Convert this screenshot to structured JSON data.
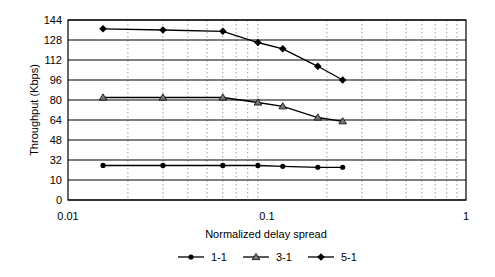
{
  "chart_data": {
    "type": "line",
    "title": "",
    "xlabel": "Normalized delay spread",
    "ylabel": "Throughput (Kbps)",
    "xscale": "log",
    "xlim": [
      0.01,
      1
    ],
    "x_tick_labels": [
      "0.01",
      "0.1",
      "1"
    ],
    "y_tick_labels": [
      "0",
      "10",
      "32",
      "48",
      "64",
      "80",
      "96",
      "112",
      "128",
      "144"
    ],
    "y_ticks": [
      0,
      10,
      32,
      48,
      64,
      80,
      96,
      112,
      128,
      144
    ],
    "grid": {
      "horizontal": "solid",
      "vertical_minor": "dotted"
    },
    "legend_position": "bottom",
    "x": [
      0.015,
      0.03,
      0.06,
      0.09,
      0.12,
      0.18,
      0.24
    ],
    "series": [
      {
        "name": "1-1",
        "marker": "circle",
        "values": [
          26,
          26,
          26,
          26,
          25,
          24,
          24
        ]
      },
      {
        "name": "3-1",
        "marker": "triangle",
        "values": [
          82,
          82,
          82,
          78,
          75,
          66,
          63
        ]
      },
      {
        "name": "5-1",
        "marker": "diamond",
        "values": [
          137,
          136,
          135,
          126,
          121,
          107,
          96
        ]
      }
    ]
  },
  "colors": {
    "line": "#000000",
    "grid": "#000000",
    "minor_grid": "#888888",
    "marker_triangle_fill": "#777777"
  }
}
